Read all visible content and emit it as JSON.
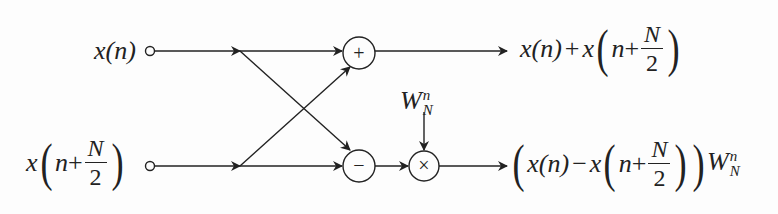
{
  "diagram": {
    "inputs": {
      "top": {
        "label": "x(n)",
        "func": "x",
        "arg": "n"
      },
      "bottom": {
        "label": "x(n + N/2)",
        "func": "x",
        "arg_var": "n",
        "op": "+",
        "frac_num": "N",
        "frac_den": "2"
      }
    },
    "nodes": {
      "adder": {
        "symbol": "+"
      },
      "subtractor": {
        "symbol": "−"
      },
      "multiplier": {
        "symbol": "×"
      }
    },
    "twiddle": {
      "label": "W_N^n",
      "base": "W",
      "sub": "N",
      "sup": "n"
    },
    "outputs": {
      "top": {
        "label": "x(n) + x(n + N/2)",
        "t1": "x(n)",
        "op": "+",
        "func": "x",
        "arg_var": "n",
        "op2": "+",
        "frac_num": "N",
        "frac_den": "2"
      },
      "bottom": {
        "label": "(x(n) − x(n + N/2)) W_N^n",
        "t1": "x(n)",
        "op": "−",
        "func": "x",
        "arg_var": "n",
        "op2": "+",
        "frac_num": "N",
        "frac_den": "2",
        "base": "W",
        "sub": "N",
        "sup": "n"
      }
    },
    "colors": {
      "stroke": "#222222",
      "background": "#fdfdfd"
    }
  }
}
